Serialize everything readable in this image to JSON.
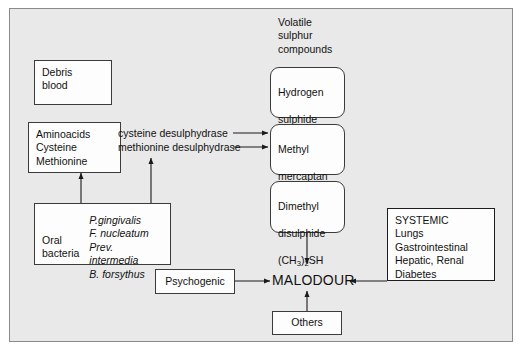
{
  "diagram": {
    "title_label": "Volatile\nsulphur\ncompounds",
    "nodes": {
      "debris": "Debris\nblood",
      "aminoacids": "Aminoacids\nCysteine\nMethionine",
      "oral_bacteria_label": "Oral\nbacteria",
      "oral_bacteria_species": "P.gingivalis\nF. nucleatum\nPrev. intermedia\nB. forsythus",
      "hydrogen_sulphide_line1": "Hydrogen",
      "hydrogen_sulphide_line2": "sulphide",
      "hydrogen_sulphide_formula_pre": "H",
      "hydrogen_sulphide_formula_sub": "2",
      "hydrogen_sulphide_formula_post": "S",
      "methyl_mercaptan_line1": "Methyl",
      "methyl_mercaptan_line2": "mercaptan",
      "methyl_mercaptan_formula_pre": "CH",
      "methyl_mercaptan_formula_sub": "3",
      "methyl_mercaptan_formula_post": "SH",
      "dimethyl_disulphide_line1": "Dimethyl",
      "dimethyl_disulphide_line2": "disulphide",
      "dimethyl_formula_a": "(CH",
      "dimethyl_formula_sub1": "3",
      "dimethyl_formula_b": ")",
      "dimethyl_formula_sub2": "2",
      "dimethyl_formula_c": "SH",
      "systemic": "SYSTEMIC\nLungs\nGastrointestinal\nHepatic, Renal\nDiabetes",
      "psychogenic": "Psychogenic",
      "others": "Others",
      "malodour": "MALODOUR"
    },
    "enzymes": {
      "cysteine": "cysteine desulphydrase",
      "methionine": "methionine desulphydrase"
    },
    "colors": {
      "background": "#e9e9e9",
      "page": "#ffffff",
      "frame_border": "#8a8a8a",
      "node_fill": "#fdfdfd",
      "node_border": "#3b3b3b",
      "text": "#111111",
      "arrow": "#1a1a1a"
    }
  }
}
